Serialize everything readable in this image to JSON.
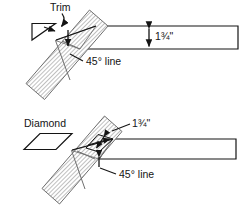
{
  "figure": {
    "background_color": "#ffffff",
    "line_color": "#141414",
    "hatch_color": "#8c8c8c",
    "board_fill": "#ffffff"
  },
  "panels": [
    {
      "id": "top",
      "callout_label": "Trim",
      "callout_shape": "right-triangle",
      "dimension_label": "1¾\"",
      "angle_label": "45° line",
      "diagonal_board": "hatched",
      "horizontal_board": "plain"
    },
    {
      "id": "bottom",
      "callout_label": "Diamond",
      "callout_shape": "parallelogram",
      "dimension_label": "1¾\"",
      "angle_label": "45° line",
      "diagonal_board": "hatched",
      "horizontal_board": "plain"
    }
  ]
}
